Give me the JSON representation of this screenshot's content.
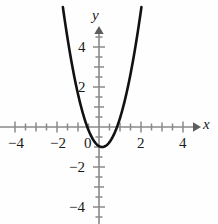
{
  "chart_data": {
    "type": "line",
    "title": "",
    "xlabel": "x",
    "ylabel": "y",
    "xlim": [
      -4.7,
      4.7
    ],
    "ylim": [
      -4.9,
      4.9
    ],
    "grid": false,
    "legend": "none",
    "curve": {
      "name": "parabola",
      "equation": "y = 2(x - 0.15)^2 - 1",
      "vertex": [
        0.15,
        -1.0
      ],
      "leading_coefficient": 2.0,
      "x_intercepts": [
        -0.56,
        0.86
      ],
      "y_intercept": -0.955,
      "color": "#111111",
      "x": [
        -1.72,
        -1.6,
        -1.4,
        -1.2,
        -1.0,
        -0.8,
        -0.6,
        -0.4,
        -0.2,
        0.0,
        0.15,
        0.3,
        0.5,
        0.7,
        0.9,
        1.1,
        1.3,
        1.5,
        1.7,
        1.9,
        2.02
      ],
      "y": [
        4.88,
        4.12,
        3.0,
        2.0,
        1.65,
        0.8,
        0.12,
        -0.4,
        -0.75,
        -0.96,
        -1.0,
        -0.96,
        -0.76,
        -0.4,
        0.12,
        0.8,
        1.64,
        2.65,
        3.8,
        5.12,
        5.85
      ]
    },
    "x_axis": {
      "major_ticks": [
        -4,
        -2,
        0,
        2,
        4
      ],
      "major_tick_labels": [
        "−4",
        "−2",
        "0",
        "2",
        "4"
      ],
      "minor_tick_step": 0.5,
      "arrow": "right",
      "color": "#8a8a8a"
    },
    "y_axis": {
      "major_ticks": [
        4,
        2,
        -2,
        -4
      ],
      "major_tick_labels": [
        "4",
        "2",
        "−2",
        "−4"
      ],
      "minor_tick_step": 0.5,
      "arrow": "up",
      "color": "#8a8a8a"
    },
    "colors": {
      "background": "#fefefe",
      "curve": "#111111",
      "axis": "#8a8a8a",
      "text": "#1a1a1a"
    }
  },
  "labels": {
    "x_name": "x",
    "y_name": "y",
    "x_ticks": [
      {
        "text": "−4",
        "left": 8,
        "top": 136
      },
      {
        "text": "−2",
        "left": 50,
        "top": 136
      },
      {
        "text": "0",
        "left": 82,
        "top": 136
      },
      {
        "text": "2",
        "left": 136,
        "top": 136
      },
      {
        "text": "4",
        "left": 178,
        "top": 136
      }
    ],
    "y_ticks": [
      {
        "text": "4",
        "left": 76,
        "top": 40
      },
      {
        "text": "2",
        "left": 76,
        "top": 80
      },
      {
        "text": "−2",
        "left": 68,
        "top": 160
      },
      {
        "text": "−4",
        "left": 68,
        "top": 200
      }
    ]
  }
}
